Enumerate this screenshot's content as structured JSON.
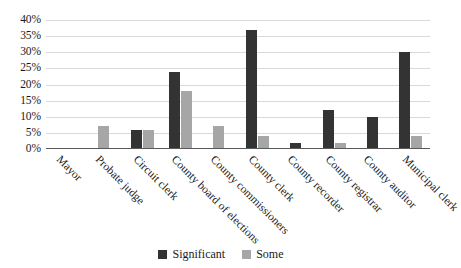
{
  "chart_data": {
    "type": "bar",
    "title": "",
    "xlabel": "",
    "ylabel": "",
    "ylim": [
      0,
      40
    ],
    "ytick_labels": [
      "40%",
      "35%",
      "30%",
      "25%",
      "20%",
      "15%",
      "10%",
      "5%",
      "0%"
    ],
    "ytick_values": [
      40,
      35,
      30,
      25,
      20,
      15,
      10,
      5,
      0
    ],
    "grid": true,
    "legend_position": "bottom",
    "categories": [
      "Mayor",
      "Probate judge",
      "Circuit clerk",
      "County board of elections",
      "County commissioners",
      "County clerk",
      "County recorder",
      "County registrar",
      "County auditor",
      "Municipal clerk"
    ],
    "series": [
      {
        "name": "Significant",
        "color": "#333333",
        "values": [
          0,
          0,
          6,
          24,
          0,
          37,
          2,
          12,
          10,
          30
        ]
      },
      {
        "name": "Some",
        "color": "#a6a6a6",
        "values": [
          0,
          7,
          6,
          18,
          7,
          4,
          0,
          2,
          0,
          4
        ]
      }
    ]
  },
  "colors": {
    "significant": "#333333",
    "some": "#a6a6a6",
    "gridline": "#d9d9d9",
    "axis": "#5a5a5a",
    "text": "#1a1a1a",
    "background": "#ffffff"
  }
}
